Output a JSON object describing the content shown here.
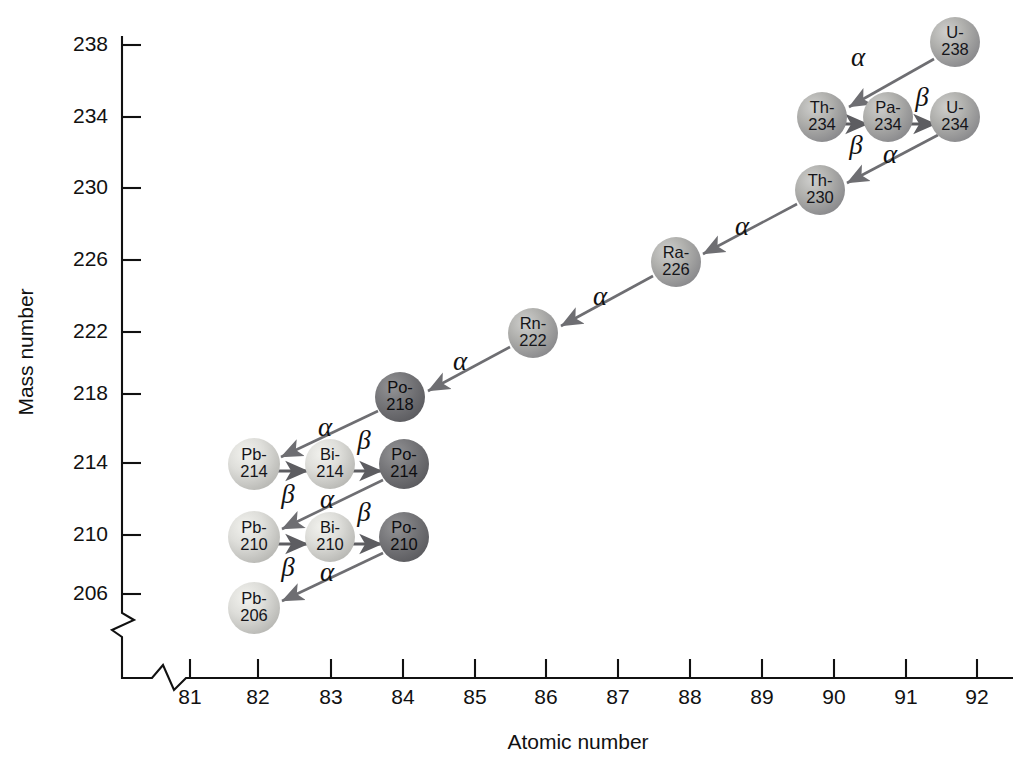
{
  "figure": {
    "background_color": "#ffffff"
  },
  "axes": {
    "x": {
      "label": "Atomic number",
      "ticks": [
        "81",
        "82",
        "83",
        "84",
        "85",
        "86",
        "87",
        "88",
        "89",
        "90",
        "91",
        "92"
      ],
      "min": 81,
      "max": 92,
      "broken": true
    },
    "y": {
      "label": "Mass number",
      "ticks": [
        "238",
        "234",
        "230",
        "226",
        "222",
        "218",
        "214",
        "210",
        "206"
      ],
      "min": 206,
      "max": 238,
      "broken": true
    }
  },
  "colors": {
    "axis": "#111111",
    "arrow": "#6e6e72",
    "sphere_light": "#d4d4d0",
    "sphere_medium": "#a8a8a6",
    "sphere_dark": "#6e6e70",
    "text": "#111111"
  },
  "chart_data": {
    "type": "scatter",
    "xlabel": "Atomic number",
    "ylabel": "Mass number",
    "xlim": [
      80.5,
      92.5
    ],
    "ylim": [
      204,
      240
    ],
    "grid": false,
    "legend": null,
    "nuclides": [
      {
        "label_line1": "U-",
        "label_line2": "238",
        "z": 92,
        "a": 238,
        "px": 955,
        "py": 42,
        "shade": "medium",
        "r": 25
      },
      {
        "label_line1": "Th-",
        "label_line2": "234",
        "z": 90,
        "a": 234,
        "px": 822,
        "py": 117,
        "shade": "medium",
        "r": 25
      },
      {
        "label_line1": "Pa-",
        "label_line2": "234",
        "z": 91,
        "a": 234,
        "px": 888,
        "py": 117,
        "shade": "medium",
        "r": 25
      },
      {
        "label_line1": "U-",
        "label_line2": "234",
        "z": 92,
        "a": 234,
        "px": 955,
        "py": 117,
        "shade": "medium",
        "r": 25
      },
      {
        "label_line1": "Th-",
        "label_line2": "230",
        "z": 90,
        "a": 230,
        "px": 820,
        "py": 190,
        "shade": "medium",
        "r": 25
      },
      {
        "label_line1": "Ra-",
        "label_line2": "226",
        "z": 88,
        "a": 226,
        "px": 676,
        "py": 262,
        "shade": "medium",
        "r": 25
      },
      {
        "label_line1": "Rn-",
        "label_line2": "222",
        "z": 86,
        "a": 222,
        "px": 533,
        "py": 333,
        "shade": "medium",
        "r": 25
      },
      {
        "label_line1": "Po-",
        "label_line2": "218",
        "z": 84,
        "a": 218,
        "px": 400,
        "py": 397,
        "shade": "dark",
        "r": 25
      },
      {
        "label_line1": "Pb-",
        "label_line2": "214",
        "z": 82,
        "a": 214,
        "px": 254,
        "py": 464,
        "shade": "light",
        "r": 26
      },
      {
        "label_line1": "Bi-",
        "label_line2": "214",
        "z": 83,
        "a": 214,
        "px": 330,
        "py": 464,
        "shade": "light",
        "r": 25
      },
      {
        "label_line1": "Po-",
        "label_line2": "214",
        "z": 84,
        "a": 214,
        "px": 404,
        "py": 464,
        "shade": "dark",
        "r": 25
      },
      {
        "label_line1": "Pb-",
        "label_line2": "210",
        "z": 82,
        "a": 210,
        "px": 254,
        "py": 537,
        "shade": "light",
        "r": 26
      },
      {
        "label_line1": "Bi-",
        "label_line2": "210",
        "z": 83,
        "a": 210,
        "px": 330,
        "py": 537,
        "shade": "light",
        "r": 25
      },
      {
        "label_line1": "Po-",
        "label_line2": "210",
        "z": 84,
        "a": 210,
        "px": 404,
        "py": 537,
        "shade": "dark",
        "r": 25
      },
      {
        "label_line1": "Pb-",
        "label_line2": "206",
        "z": 82,
        "a": 206,
        "px": 254,
        "py": 608,
        "shade": "light",
        "r": 26
      }
    ],
    "decays": [
      {
        "from": "U-238",
        "to": "Th-234",
        "type": "alpha",
        "symbol": "α",
        "lx": 858,
        "ly": 66
      },
      {
        "from": "Th-234",
        "to": "Pa-234",
        "type": "beta",
        "symbol": "β",
        "lx": 856,
        "ly": 154
      },
      {
        "from": "Pa-234",
        "to": "U-234",
        "type": "beta",
        "symbol": "β",
        "lx": 922,
        "ly": 106
      },
      {
        "from": "U-234",
        "to": "Th-230",
        "type": "alpha",
        "symbol": "α",
        "lx": 890,
        "ly": 163
      },
      {
        "from": "Th-230",
        "to": "Ra-226",
        "type": "alpha",
        "symbol": "α",
        "lx": 742,
        "ly": 235
      },
      {
        "from": "Ra-226",
        "to": "Rn-222",
        "type": "alpha",
        "symbol": "α",
        "lx": 600,
        "ly": 305
      },
      {
        "from": "Rn-222",
        "to": "Po-218",
        "type": "alpha",
        "symbol": "α",
        "lx": 460,
        "ly": 370
      },
      {
        "from": "Po-218",
        "to": "Pb-214",
        "type": "alpha",
        "symbol": "α",
        "lx": 325,
        "ly": 436
      },
      {
        "from": "Pb-214",
        "to": "Bi-214",
        "type": "beta",
        "symbol": "β",
        "lx": 288,
        "ly": 503
      },
      {
        "from": "Bi-214",
        "to": "Po-214",
        "type": "beta",
        "symbol": "β",
        "lx": 364,
        "ly": 449
      },
      {
        "from": "Po-214",
        "to": "Pb-210",
        "type": "alpha",
        "symbol": "α",
        "lx": 327,
        "ly": 508
      },
      {
        "from": "Pb-210",
        "to": "Bi-210",
        "type": "beta",
        "symbol": "β",
        "lx": 288,
        "ly": 576
      },
      {
        "from": "Bi-210",
        "to": "Po-210",
        "type": "beta",
        "symbol": "β",
        "lx": 364,
        "ly": 521
      },
      {
        "from": "Po-210",
        "to": "Pb-206",
        "type": "alpha",
        "symbol": "α",
        "lx": 327,
        "ly": 581
      }
    ]
  }
}
